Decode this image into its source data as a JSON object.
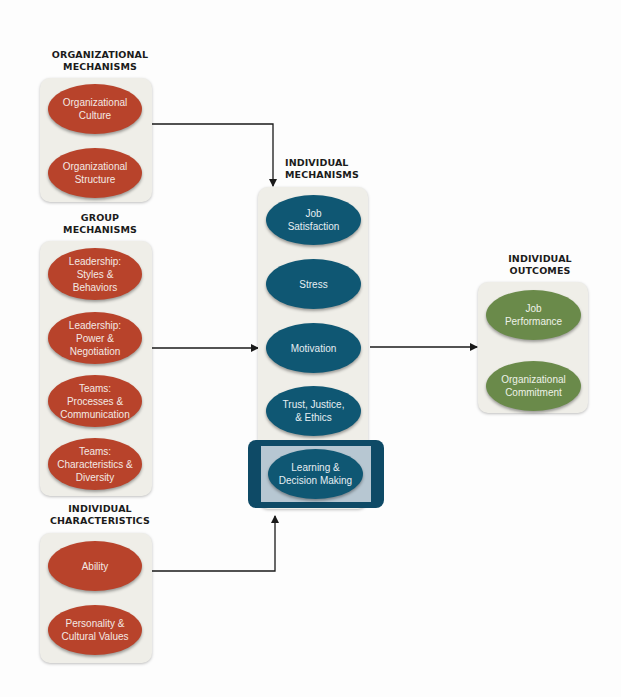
{
  "groups": {
    "organizational": {
      "heading": "ORGANIZATIONAL\nMECHANISMS",
      "heading_lines": [
        "ORGANIZATIONAL",
        "MECHANISMS"
      ],
      "items": [
        "Organizational\nCulture",
        "Organizational\nStructure"
      ]
    },
    "group": {
      "heading_lines": [
        "GROUP",
        "MECHANISMS"
      ],
      "items": [
        "Leadership:\nStyles &\nBehaviors",
        "Leadership:\nPower &\nNegotiation",
        "Teams:\nProcesses &\nCommunication",
        "Teams:\nCharacteristics &\nDiversity"
      ]
    },
    "individual_characteristics": {
      "heading_lines": [
        "INDIVIDUAL",
        "CHARACTERISTICS"
      ],
      "items": [
        "Ability",
        "Personality &\nCultural Values"
      ]
    },
    "individual_mechanisms": {
      "heading_lines": [
        "INDIVIDUAL",
        "MECHANISMS"
      ],
      "items": [
        "Job\nSatisfaction",
        "Stress",
        "Motivation",
        "Trust, Justice,\n& Ethics",
        "Learning &\nDecision Making"
      ],
      "highlighted_item": "Learning &\nDecision Making"
    },
    "individual_outcomes": {
      "heading_lines": [
        "INDIVIDUAL",
        "OUTCOMES"
      ],
      "items": [
        "Job\nPerformance",
        "Organizational\nCommitment"
      ]
    }
  },
  "colors": {
    "organizational_oval": "#b8432b",
    "mechanism_oval": "#0f5773",
    "outcome_oval": "#6a8a4a",
    "panel_background": "#efeee8",
    "highlight_frame": "#0e4a66",
    "arrow": "#1a1a1a"
  }
}
